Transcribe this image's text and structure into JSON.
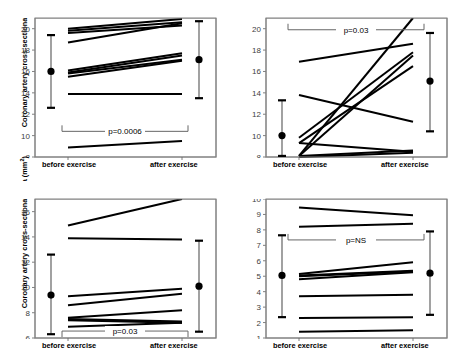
{
  "figure": {
    "shared_ylabel": "Coronary artery cross-sectional area (mm",
    "shared_ylabel_sup": "2",
    "shared_ylabel_end": ")",
    "x_categories": [
      "before exercise",
      "after exercise"
    ],
    "line_color": "#000000",
    "axis_color": "#808080",
    "marker_color": "#000000"
  },
  "chart_data": [
    {
      "panel_id": "left-main",
      "type": "line",
      "title": "Left main coronary artery",
      "xlabel": "",
      "ylabel": "Coronary artery cross-sectional area (mm2)",
      "categories": [
        "before exercise",
        "after exercise"
      ],
      "ylim": [
        8,
        21
      ],
      "yticks": [
        8,
        10,
        12,
        14,
        16,
        18,
        20
      ],
      "grid": false,
      "legend": "none",
      "annotation": "p=0.0006",
      "annotation_y": 10.4,
      "series": [
        {
          "name": "subject-1",
          "values": [
            20.0,
            20.9
          ]
        },
        {
          "name": "subject-2",
          "values": [
            19.8,
            20.6
          ]
        },
        {
          "name": "subject-3",
          "values": [
            19.6,
            20.3
          ]
        },
        {
          "name": "subject-4",
          "values": [
            18.7,
            20.5
          ]
        },
        {
          "name": "subject-5",
          "values": [
            16.1,
            17.7
          ]
        },
        {
          "name": "subject-6",
          "values": [
            15.9,
            17.5
          ]
        },
        {
          "name": "subject-7",
          "values": [
            15.8,
            17.1
          ]
        },
        {
          "name": "subject-8",
          "values": [
            15.5,
            17.0
          ]
        },
        {
          "name": "subject-9",
          "values": [
            13.9,
            13.9
          ]
        },
        {
          "name": "subject-10",
          "values": [
            8.9,
            9.5
          ]
        }
      ],
      "means": [
        {
          "x": "before exercise",
          "mean": 16.0,
          "lower": 12.6,
          "upper": 19.4
        },
        {
          "x": "after exercise",
          "mean": 17.1,
          "lower": 13.5,
          "upper": 20.7
        }
      ]
    },
    {
      "panel_id": "rca-proximal",
      "type": "line",
      "title": "Right coronary artery (proximal)",
      "xlabel": "",
      "ylabel": "",
      "categories": [
        "before exercise",
        "after exercise"
      ],
      "ylim": [
        8,
        21
      ],
      "yticks": [
        8,
        10,
        12,
        14,
        16,
        18,
        20
      ],
      "grid": false,
      "legend": "none",
      "annotation": "p=0.03",
      "annotation_y": 19.9,
      "series": [
        {
          "name": "subject-1",
          "values": [
            16.9,
            18.6
          ]
        },
        {
          "name": "subject-2",
          "values": [
            13.8,
            11.3
          ]
        },
        {
          "name": "subject-3",
          "values": [
            9.8,
            17.8
          ]
        },
        {
          "name": "subject-4",
          "values": [
            9.3,
            16.5
          ]
        },
        {
          "name": "subject-5",
          "values": [
            8.1,
            17.5
          ]
        },
        {
          "name": "subject-6",
          "values": [
            8.1,
            21.0
          ]
        },
        {
          "name": "subject-7",
          "values": [
            8.1,
            8.6
          ]
        },
        {
          "name": "subject-8",
          "values": [
            9.3,
            8.5
          ]
        },
        {
          "name": "subject-9",
          "values": [
            8.0,
            8.4
          ]
        }
      ],
      "means": [
        {
          "x": "before exercise",
          "mean": 10.0,
          "lower": 8.1,
          "upper": 13.3
        },
        {
          "x": "after exercise",
          "mean": 15.1,
          "lower": 10.4,
          "upper": 19.6
        }
      ]
    },
    {
      "panel_id": "lad-proximal",
      "type": "line",
      "title": "Left anterior descending coronary artery (proximal)",
      "xlabel": "",
      "ylabel": "Coronary artery cross-sectional area (mm2)",
      "categories": [
        "before exercise",
        "after exercise"
      ],
      "ylim": [
        6,
        17
      ],
      "yticks": [
        6,
        8,
        10,
        12,
        14,
        16
      ],
      "grid": false,
      "legend": "none",
      "annotation": "p=0.03",
      "annotation_y": 6.55,
      "series": [
        {
          "name": "subject-1",
          "values": [
            14.9,
            17.0
          ]
        },
        {
          "name": "subject-2",
          "values": [
            13.9,
            13.8
          ]
        },
        {
          "name": "subject-3",
          "values": [
            9.3,
            9.9
          ]
        },
        {
          "name": "subject-4",
          "values": [
            8.6,
            9.5
          ]
        },
        {
          "name": "subject-5",
          "values": [
            7.6,
            8.2
          ]
        },
        {
          "name": "subject-6",
          "values": [
            7.5,
            7.3
          ]
        },
        {
          "name": "subject-7",
          "values": [
            7.4,
            7.2
          ]
        },
        {
          "name": "subject-8",
          "values": [
            6.9,
            7.2
          ]
        }
      ],
      "means": [
        {
          "x": "before exercise",
          "mean": 9.4,
          "lower": 6.3,
          "upper": 12.6
        },
        {
          "x": "after exercise",
          "mean": 10.1,
          "lower": 6.5,
          "upper": 13.7
        }
      ]
    },
    {
      "panel_id": "lcx-proximal",
      "type": "line",
      "title": "Left circumflex coronary artery (proximal)",
      "xlabel": "",
      "ylabel": "",
      "categories": [
        "before exercise",
        "after exercise"
      ],
      "ylim": [
        1,
        10
      ],
      "yticks": [
        1,
        2,
        3,
        4,
        5,
        6,
        7,
        8,
        9,
        10
      ],
      "grid": false,
      "legend": "none",
      "annotation": "p=NS",
      "annotation_y": 7.35,
      "series": [
        {
          "name": "subject-1",
          "values": [
            9.45,
            8.95
          ]
        },
        {
          "name": "subject-2",
          "values": [
            8.2,
            8.4
          ]
        },
        {
          "name": "subject-3",
          "values": [
            5.15,
            5.9
          ]
        },
        {
          "name": "subject-4",
          "values": [
            5.05,
            5.35
          ]
        },
        {
          "name": "subject-5",
          "values": [
            5.0,
            5.3
          ]
        },
        {
          "name": "subject-6",
          "values": [
            4.8,
            5.25
          ]
        },
        {
          "name": "subject-7",
          "values": [
            3.7,
            3.8
          ]
        },
        {
          "name": "subject-8",
          "values": [
            2.3,
            2.35
          ]
        },
        {
          "name": "subject-9",
          "values": [
            1.4,
            1.5
          ]
        }
      ],
      "means": [
        {
          "x": "before exercise",
          "mean": 5.05,
          "lower": 2.35,
          "upper": 7.65
        },
        {
          "x": "after exercise",
          "mean": 5.2,
          "lower": 2.5,
          "upper": 7.9
        }
      ]
    }
  ]
}
